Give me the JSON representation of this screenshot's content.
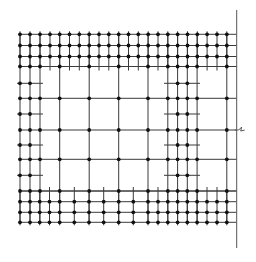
{
  "diagram": {
    "type": "mesh-grid",
    "width": 256,
    "height": 262,
    "colors": {
      "line": "#3a3a3a",
      "border": "#555555",
      "node": "#111111",
      "background": "#ffffff"
    },
    "border": {
      "x": 236.7,
      "y1": 10,
      "y2": 248
    },
    "break_symbol": {
      "x": 236.7,
      "y": 130
    },
    "top_band": {
      "rows": [
        34.3,
        45.5,
        56.5,
        66.5
      ],
      "x_start": 20,
      "x_end": 236.7,
      "columns": [
        20,
        30,
        40,
        50,
        59.7,
        69.5,
        79.3,
        89.2,
        99,
        108.8,
        118.7,
        128.5,
        138.3,
        148.2,
        158,
        167.8,
        177.6,
        187.5,
        197.3,
        207.1,
        217,
        226.8
      ],
      "tick_below": 4
    },
    "bottom_band": {
      "rows": [
        191,
        201.7,
        212.3,
        222.3
      ],
      "x_start": 20,
      "x_end": 236.7,
      "columns": [
        20,
        30,
        39.7,
        49.5,
        59.7,
        74.3,
        89,
        103.7,
        118.7,
        133.3,
        148,
        158,
        167.8,
        177.6,
        187.3,
        197.1,
        207,
        217,
        226.8
      ],
      "tick_above": 4
    },
    "main_columns": [
      20,
      30,
      40,
      59.7,
      89.2,
      118.7,
      148,
      167.8,
      177.6,
      187.3,
      197.1,
      226.8
    ],
    "first_row_nodes": [
      20,
      30,
      40,
      59.7,
      89.2,
      118.7,
      148,
      167.8,
      177.6,
      187.3,
      197.1,
      226.8
    ],
    "middle_full_rows": [
      66.5,
      98.3,
      130,
      159.3,
      191
    ],
    "middle_full_row_nodes": [
      20,
      30,
      40,
      59.7,
      89.2,
      118.7,
      148,
      167.8,
      177.6,
      187.3,
      197.1,
      226.8
    ],
    "middle_short_rows": [
      83.3,
      114,
      145,
      175.3
    ],
    "left_short": {
      "x1": 17,
      "x2": 43,
      "nodes": [
        20,
        30
      ]
    },
    "right_short": {
      "x1": 164,
      "x2": 200,
      "nodes": [
        177.6,
        187.3
      ]
    }
  }
}
